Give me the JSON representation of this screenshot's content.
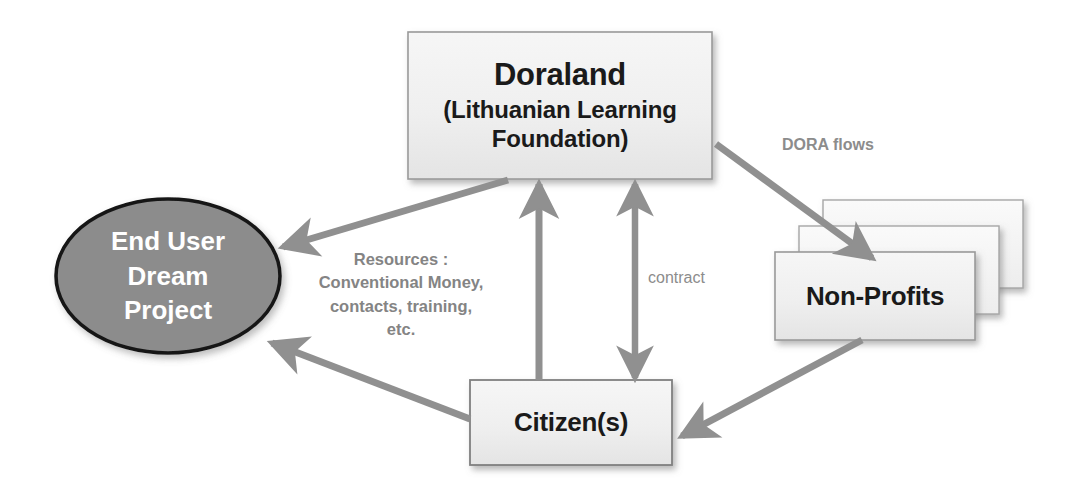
{
  "diagram": {
    "colors": {
      "box_fill_top": "#f2f2f2",
      "box_fill_bottom": "#e8e8e8",
      "box_border": "#9a9a9a",
      "ellipse_fill": "#8c8c8c",
      "ellipse_border": "#1a1a1a",
      "arrow": "#909090",
      "label_text": "#8a8a8a",
      "node_text": "#1a1a1a",
      "ellipse_text": "#ffffff"
    }
  },
  "nodes": {
    "doraland": {
      "title": "Doraland",
      "subtitle_line1": "(Lithuanian Learning",
      "subtitle_line2": "Foundation)"
    },
    "end_user": {
      "line1": "End User",
      "line2": "Dream",
      "line3": "Project"
    },
    "non_profits": {
      "label": "Non-Profits",
      "stack_count": "3"
    },
    "citizens": {
      "label": "Citizen(s)"
    }
  },
  "edges": {
    "doraland_to_nonprofits": {
      "label": "DORA flows"
    },
    "doraland_to_enduser": {
      "label_line1": "Resources :",
      "label_line2": "Conventional Money,",
      "label_line3": "contacts, training,",
      "label_line4": "etc."
    },
    "doraland_citizens_contract": {
      "label": "contract"
    },
    "citizens_to_doraland": {
      "label": ""
    },
    "nonprofits_to_citizens": {
      "label": ""
    },
    "citizens_to_enduser": {
      "label": ""
    }
  }
}
